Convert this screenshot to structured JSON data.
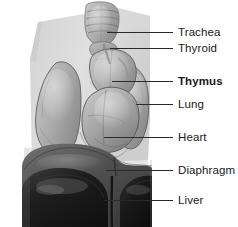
{
  "figure": {
    "width": 238,
    "height": 227,
    "background_color": "#ffffff",
    "illustration_style": "grayscale anatomical airbrush rendering of the upper torso showing thoracic organs"
  },
  "colors": {
    "label_text": "#1a1a1a",
    "leader_line": "#2a2a2a",
    "torso_silhouette": "#dcdcdc",
    "organ_light": "#c4c4c4",
    "organ_mid": "#a6a6a6",
    "organ_dark": "#7d7d7d",
    "diaphragm_dark": "#4a4a4a",
    "liver_dark": "#222222",
    "outline": "#3a3a3a"
  },
  "labels": [
    {
      "id": "trachea",
      "text": "Trachea",
      "bold": false,
      "text_x": 178,
      "text_y": 25,
      "leader_x": 107,
      "leader_y": 32,
      "leader_width": 66,
      "target": "ringed tube at top center of the neck"
    },
    {
      "id": "thyroid",
      "text": "Thyroid",
      "bold": false,
      "text_x": 178,
      "text_y": 41,
      "leader_x": 110,
      "leader_y": 48,
      "leader_width": 63,
      "target": "gland just below the trachea rings"
    },
    {
      "id": "thymus",
      "text": "Thymus",
      "bold": true,
      "text_x": 178,
      "text_y": 74,
      "leader_x": 112,
      "leader_y": 81,
      "leader_width": 61,
      "target": "bilobed gland above the heart"
    },
    {
      "id": "lung",
      "text": "Lung",
      "bold": false,
      "text_x": 178,
      "text_y": 97,
      "leader_x": 136,
      "leader_y": 104,
      "leader_width": 37,
      "target": "right lung lobe at image right"
    },
    {
      "id": "heart",
      "text": "Heart",
      "bold": false,
      "text_x": 178,
      "text_y": 130,
      "leader_x": 104,
      "leader_y": 137,
      "leader_width": 69,
      "target": "heart below and right of the thymus"
    },
    {
      "id": "diaphragm",
      "text": "Diaphragm",
      "bold": false,
      "text_x": 178,
      "text_y": 163,
      "leader_x": 106,
      "leader_y": 170,
      "leader_width": 67,
      "target": "domed muscle sheet beneath the lungs"
    },
    {
      "id": "liver",
      "text": "Liver",
      "bold": false,
      "text_x": 178,
      "text_y": 193,
      "leader_x": 104,
      "leader_y": 200,
      "leader_width": 69,
      "target": "large dark organ below the diaphragm"
    }
  ],
  "organ_names": {
    "trachea": "trachea",
    "thyroid": "thyroid",
    "thymus": "thymus",
    "lung_left": "left lung",
    "lung_right": "right lung",
    "heart": "heart",
    "diaphragm": "diaphragm",
    "liver": "liver"
  }
}
